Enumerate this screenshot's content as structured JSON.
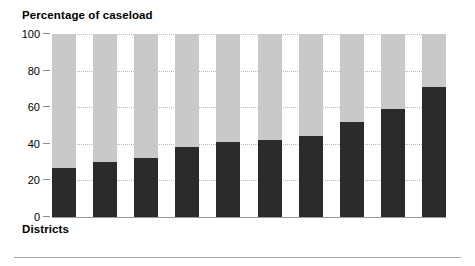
{
  "chart_data": {
    "type": "bar",
    "subtype": "stacked-percentage",
    "title": "Percentage of caseload",
    "xlabel": "Districts",
    "ylabel": "",
    "ylim": [
      0,
      100
    ],
    "yticks": [
      0,
      20,
      40,
      60,
      80,
      100
    ],
    "ytick_labels": [
      "0",
      "20",
      "40",
      "60",
      "80",
      "100"
    ],
    "grid": true,
    "grid_axis": "y",
    "legend": "none",
    "categories": [
      "1",
      "2",
      "3",
      "4",
      "5",
      "6",
      "7",
      "8",
      "9",
      "10"
    ],
    "series": [
      {
        "name": "Lower segment",
        "color": "#2b2b2b",
        "values": [
          27,
          30,
          32,
          38,
          41,
          42,
          44,
          52,
          59,
          71
        ]
      },
      {
        "name": "Upper segment",
        "color": "#c9c9c9",
        "values": [
          73,
          70,
          68,
          62,
          59,
          58,
          56,
          48,
          41,
          29
        ]
      }
    ],
    "total": 100,
    "bar_count": 10,
    "annotations": []
  },
  "colors": {
    "dark": "#2b2b2b",
    "light": "#c9c9c9",
    "gridline": "#b9b9b9",
    "axis": "#9a9a9a",
    "rule": "#a6a6a6",
    "text": "#000000",
    "background": "#ffffff"
  }
}
